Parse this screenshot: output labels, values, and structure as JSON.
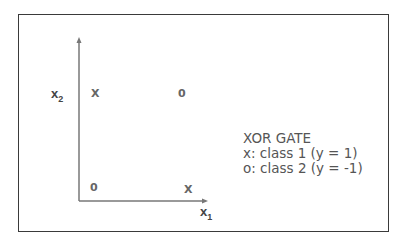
{
  "diagram": {
    "axes": {
      "x_label": "x",
      "x_sub": "1",
      "y_label": "x",
      "y_sub": "2"
    },
    "points": [
      {
        "symbol": "X",
        "x1": 0,
        "x2": 1,
        "class": "class 1"
      },
      {
        "symbol": "0",
        "x1": 1,
        "x2": 1,
        "class": "class 2"
      },
      {
        "symbol": "0",
        "x1": 0,
        "x2": 0,
        "class": "class 2"
      },
      {
        "symbol": "X",
        "x1": 1,
        "x2": 0,
        "class": "class 1"
      }
    ],
    "legend": {
      "title": "XOR GATE",
      "line1": "x: class 1 (y = 1)",
      "line2": "o: class 2 (y = -1)"
    }
  }
}
